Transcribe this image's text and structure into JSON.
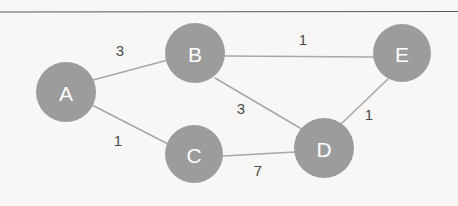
{
  "figure": {
    "type": "undirected-weighted-graph",
    "background_color": "#f8f7f5",
    "node_fill_color": "#9c9c9c",
    "node_label_color": "#ffffff",
    "edge_color": "#a8a8a8",
    "weight_label_color": "#4a4a4a",
    "rule_color": "#5a5a5a"
  },
  "rule": {
    "name": "top-horizontal-rule",
    "x1": 0,
    "y1": 12,
    "x2": 458,
    "y2": 11.5
  },
  "nodes": [
    {
      "id": "A",
      "label": "A",
      "cx": 66,
      "cy": 92,
      "r": 30
    },
    {
      "id": "B",
      "label": "B",
      "cx": 195,
      "cy": 53,
      "r": 30
    },
    {
      "id": "C",
      "label": "C",
      "cx": 194,
      "cy": 154,
      "r": 29
    },
    {
      "id": "D",
      "label": "D",
      "cx": 324,
      "cy": 148,
      "r": 30
    },
    {
      "id": "E",
      "label": "E",
      "cx": 402,
      "cy": 53,
      "r": 29
    }
  ],
  "edges": [
    {
      "id": "A-B",
      "from": "A",
      "to": "B",
      "weight": "3",
      "x1": 93,
      "y1": 80,
      "x2": 168,
      "y2": 60,
      "label_x": 120,
      "label_y": 50
    },
    {
      "id": "A-C",
      "from": "A",
      "to": "C",
      "weight": "1",
      "x1": 92,
      "y1": 105,
      "x2": 168,
      "y2": 144,
      "label_x": 118,
      "label_y": 140
    },
    {
      "id": "B-E",
      "from": "B",
      "to": "E",
      "weight": "1",
      "x1": 225,
      "y1": 56,
      "x2": 373,
      "y2": 57,
      "label_x": 303,
      "label_y": 39
    },
    {
      "id": "B-D",
      "from": "B",
      "to": "D",
      "weight": "3",
      "x1": 215,
      "y1": 78,
      "x2": 305,
      "y2": 131,
      "label_x": 241,
      "label_y": 108
    },
    {
      "id": "C-D",
      "from": "C",
      "to": "D",
      "weight": "7",
      "x1": 223,
      "y1": 156,
      "x2": 295,
      "y2": 152,
      "label_x": 258,
      "label_y": 170
    },
    {
      "id": "D-E",
      "from": "D",
      "to": "E",
      "weight": "1",
      "x1": 341,
      "y1": 124,
      "x2": 388,
      "y2": 79,
      "label_x": 369,
      "label_y": 114
    }
  ]
}
